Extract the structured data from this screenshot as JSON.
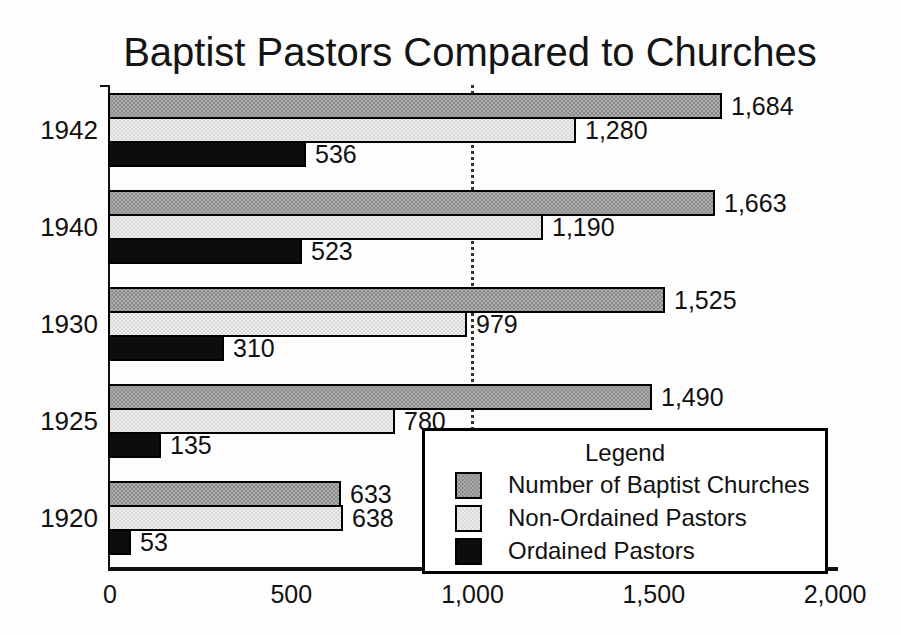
{
  "title": "Baptist Pastors Compared to Churches",
  "chart_data": {
    "type": "bar",
    "orientation": "horizontal",
    "title": "Baptist Pastors Compared to Churches",
    "categories": [
      "1942",
      "1940",
      "1930",
      "1925",
      "1920"
    ],
    "series": [
      {
        "key": "churches",
        "name": "Number of Baptist Churches",
        "color": "#ababab",
        "pattern": "halftone-dark-gray",
        "values": [
          1684,
          1663,
          1525,
          1490,
          633
        ]
      },
      {
        "key": "non-ordained",
        "name": "Non-Ordained Pastors",
        "color": "#ededed",
        "pattern": "halftone-light-gray",
        "values": [
          1280,
          1190,
          979,
          780,
          638
        ]
      },
      {
        "key": "ordained",
        "name": "Ordained Pastors",
        "color": "#0d0d0d",
        "pattern": "solid-black",
        "values": [
          536,
          523,
          310,
          135,
          53
        ]
      }
    ],
    "value_labels": [
      [
        "1,684",
        "1,280",
        "536"
      ],
      [
        "1,663",
        "1,190",
        "523"
      ],
      [
        "1,525",
        "979",
        "310"
      ],
      [
        "1,490",
        "780",
        "135"
      ],
      [
        "633",
        "638",
        "53"
      ]
    ],
    "xlabel": "",
    "ylabel": "",
    "xlim": [
      0,
      2000
    ],
    "x_tick_values": [
      0,
      500,
      1000,
      1500,
      2000
    ],
    "x_tick_labels": [
      "0",
      "500",
      "1,000",
      "1,500",
      "2,000"
    ],
    "gridline_x": 1000,
    "grid": "single vertical dotted line at 1,000",
    "bar_border_color": "#000000",
    "axis_color": "#111111",
    "background": "#fdfdfd",
    "legend": {
      "title": "Legend",
      "position": "inside-bottom-right"
    }
  }
}
